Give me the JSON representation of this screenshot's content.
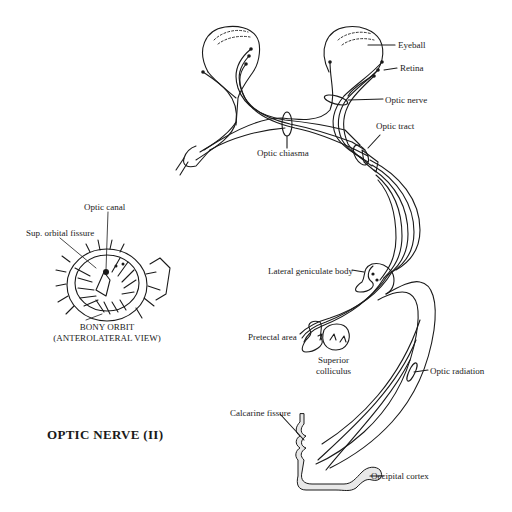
{
  "title": "OPTIC NERVE (II)",
  "labels": {
    "eyeball": "Eyeball",
    "retina": "Retina",
    "optic_nerve": "Optic nerve",
    "optic_tract": "Optic tract",
    "optic_chiasma": "Optic chiasma",
    "lateral_geniculate_body": "Lateral geniculate body",
    "pretectal_area": "Pretectal area",
    "superior_colliculus_line1": "Superior",
    "superior_colliculus_line2": "colliculus",
    "optic_radiation": "Optic radiation",
    "calcarine_fissure": "Calcarine fissure",
    "occipital_cortex": "Occipital cortex"
  },
  "inset": {
    "optic_canal": "Optic canal",
    "sup_orbital_fissure": "Sup. orbital fissure",
    "caption_line1": "BONY ORBIT",
    "caption_line2": "(ANTEROLATERAL VIEW)"
  },
  "colors": {
    "ink": "#1a1a1a",
    "background": "#ffffff",
    "cortex_fill": "#e8e8e8"
  }
}
